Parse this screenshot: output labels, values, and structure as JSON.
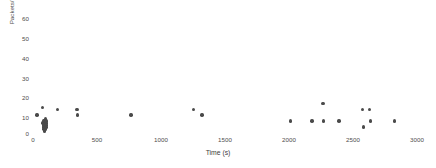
{
  "chart_data": {
    "type": "scatter",
    "title": "",
    "xlabel": "Time (s)",
    "ylabel": "Packets/1 sec",
    "xlim": [
      0,
      3000
    ],
    "ylim": [
      0,
      60
    ],
    "xticks": [
      0,
      500,
      1000,
      1500,
      2000,
      2500,
      3000
    ],
    "yticks": [
      0,
      10,
      20,
      30,
      40,
      50,
      60
    ],
    "grid": false,
    "legend": false,
    "marker": {
      "shape": "circle",
      "color": "#4a4a4a",
      "size_px": 3.4
    },
    "series": [
      {
        "name": "Packets/1 sec",
        "color": "#4a4a4a",
        "points": [
          [
            30,
            9
          ],
          [
            75,
            13
          ],
          [
            78,
            5
          ],
          [
            80,
            6
          ],
          [
            82,
            4
          ],
          [
            84,
            3
          ],
          [
            85,
            5
          ],
          [
            86,
            2
          ],
          [
            88,
            6
          ],
          [
            89,
            4
          ],
          [
            90,
            3
          ],
          [
            91,
            5
          ],
          [
            92,
            1
          ],
          [
            93,
            6
          ],
          [
            95,
            4
          ],
          [
            96,
            3
          ],
          [
            97,
            7
          ],
          [
            98,
            2
          ],
          [
            100,
            5
          ],
          [
            102,
            4
          ],
          [
            103,
            6
          ],
          [
            105,
            3
          ],
          [
            190,
            12
          ],
          [
            345,
            12
          ],
          [
            348,
            9
          ],
          [
            765,
            9
          ],
          [
            1255,
            12
          ],
          [
            1320,
            9
          ],
          [
            2010,
            6
          ],
          [
            2180,
            6
          ],
          [
            2265,
            15
          ],
          [
            2270,
            6
          ],
          [
            2390,
            6
          ],
          [
            2575,
            12
          ],
          [
            2580,
            3
          ],
          [
            2630,
            12
          ],
          [
            2635,
            6
          ],
          [
            2825,
            6
          ]
        ]
      }
    ]
  },
  "axes": {
    "y_tick_labels": [
      "60",
      "50",
      "40",
      "30",
      "20",
      "10",
      "0"
    ],
    "x_tick_labels": [
      "0",
      "500",
      "1000",
      "1500",
      "2000",
      "2500",
      "3000"
    ],
    "y_title": "Packets/1 sec",
    "x_title": "Time (s)"
  }
}
